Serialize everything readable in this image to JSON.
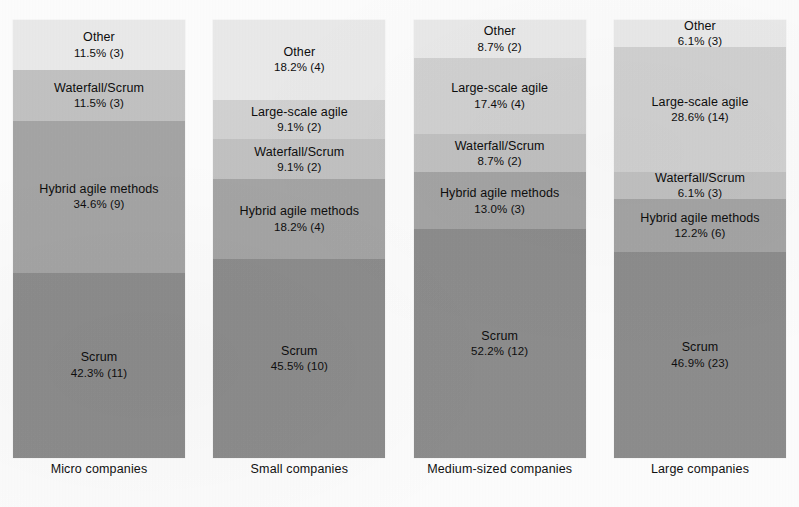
{
  "chart_data": {
    "type": "bar",
    "subtype": "100% stacked column",
    "title": "",
    "xlabel": "",
    "ylabel": "",
    "ylim": [
      0,
      100
    ],
    "grid": false,
    "legend": "none (in-segment data labels)",
    "categories": [
      "Micro companies",
      "Small companies",
      "Medium-sized companies",
      "Large companies"
    ],
    "series": [
      {
        "name": "Scrum",
        "color": "#8d8d8d",
        "values": [
          42.3,
          45.5,
          52.2,
          46.9
        ],
        "counts": [
          11,
          10,
          12,
          23
        ],
        "labels": [
          "42.3% (11)",
          "45.5% (10)",
          "52.2% (12)",
          "46.9% (23)"
        ]
      },
      {
        "name": "Hybrid agile methods",
        "color": "#a5a5a5",
        "values": [
          34.6,
          18.2,
          13.0,
          12.2
        ],
        "counts": [
          9,
          4,
          3,
          6
        ],
        "labels": [
          "34.6% (9)",
          "18.2% (4)",
          "13.0% (3)",
          "12.2% (6)"
        ]
      },
      {
        "name": "Waterfall/Scrum",
        "color": "#c2c2c2",
        "values": [
          11.5,
          9.1,
          8.7,
          6.1
        ],
        "counts": [
          3,
          2,
          2,
          3
        ],
        "labels": [
          "11.5% (3)",
          "9.1% (2)",
          "8.7% (2)",
          "6.1% (3)"
        ]
      },
      {
        "name": "Large-scale agile",
        "color": "#d2d2d2",
        "values": [
          0,
          9.1,
          17.4,
          28.6
        ],
        "counts": [
          0,
          2,
          4,
          14
        ],
        "labels": [
          "",
          "9.1% (2)",
          "17.4% (4)",
          "28.6% (14)"
        ]
      },
      {
        "name": "Other",
        "color": "#eaeaea",
        "values": [
          11.5,
          18.2,
          8.7,
          6.1
        ],
        "counts": [
          3,
          4,
          2,
          3
        ],
        "labels": [
          "11.5% (3)",
          "18.2% (4)",
          "8.7% (2)",
          "6.1% (3)"
        ]
      }
    ]
  },
  "columns": [
    {
      "axis_label": "Micro companies",
      "width_px": 172,
      "segments": [
        {
          "name": "Other",
          "value": "11.5% (3)",
          "pct": 11.5,
          "color": "#eaeaea"
        },
        {
          "name": "Waterfall/Scrum",
          "value": "11.5% (3)",
          "pct": 11.5,
          "color": "#c2c2c2"
        },
        {
          "name": "Hybrid agile methods",
          "value": "34.6% (9)",
          "pct": 34.6,
          "color": "#a5a5a5"
        },
        {
          "name": "Scrum",
          "value": "42.3% (11)",
          "pct": 42.3,
          "color": "#8d8d8d"
        }
      ]
    },
    {
      "axis_label": "Small companies",
      "width_px": 172,
      "segments": [
        {
          "name": "Other",
          "value": "18.2% (4)",
          "pct": 18.2,
          "color": "#eaeaea"
        },
        {
          "name": "Large-scale agile",
          "value": "9.1% (2)",
          "pct": 9.1,
          "color": "#d2d2d2"
        },
        {
          "name": "Waterfall/Scrum",
          "value": "9.1% (2)",
          "pct": 9.1,
          "color": "#c2c2c2"
        },
        {
          "name": "Hybrid agile methods",
          "value": "18.2% (4)",
          "pct": 18.2,
          "color": "#a5a5a5"
        },
        {
          "name": "Scrum",
          "value": "45.5% (10)",
          "pct": 45.5,
          "color": "#8d8d8d"
        }
      ]
    },
    {
      "axis_label": "Medium-sized companies",
      "width_px": 172,
      "segments": [
        {
          "name": "Other",
          "value": "8.7% (2)",
          "pct": 8.7,
          "color": "#eaeaea"
        },
        {
          "name": "Large-scale agile",
          "value": "17.4% (4)",
          "pct": 17.4,
          "color": "#d2d2d2"
        },
        {
          "name": "Waterfall/Scrum",
          "value": "8.7% (2)",
          "pct": 8.7,
          "color": "#c2c2c2"
        },
        {
          "name": "Hybrid agile methods",
          "value": "13.0% (3)",
          "pct": 13.0,
          "color": "#a5a5a5"
        },
        {
          "name": "Scrum",
          "value": "52.2% (12)",
          "pct": 52.2,
          "color": "#8d8d8d"
        }
      ]
    },
    {
      "axis_label": "Large companies",
      "width_px": 172,
      "segments": [
        {
          "name": "Other",
          "value": "6.1% (3)",
          "pct": 6.1,
          "color": "#eaeaea"
        },
        {
          "name": "Large-scale agile",
          "value": "28.6% (14)",
          "pct": 28.6,
          "color": "#d2d2d2"
        },
        {
          "name": "Waterfall/Scrum",
          "value": "6.1% (3)",
          "pct": 6.1,
          "color": "#c2c2c2"
        },
        {
          "name": "Hybrid agile methods",
          "value": "12.2% (6)",
          "pct": 12.2,
          "color": "#a5a5a5"
        },
        {
          "name": "Scrum",
          "value": "46.9% (23)",
          "pct": 46.9,
          "color": "#8d8d8d"
        }
      ]
    }
  ]
}
